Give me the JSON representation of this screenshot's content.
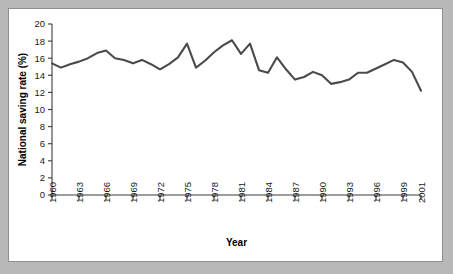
{
  "chart_data": {
    "type": "line",
    "title": "",
    "xlabel": "Year",
    "ylabel": "National saving rate (%)",
    "xlim": [
      1960,
      2001
    ],
    "ylim": [
      0,
      20
    ],
    "grid": false,
    "legend": null,
    "line_color": "#4a4a4a",
    "x_tick_labels": [
      "1960",
      "1963",
      "1966",
      "1969",
      "1972",
      "1975",
      "1978",
      "1981",
      "1984",
      "1987",
      "1990",
      "1993",
      "1996",
      "1999",
      "2001"
    ],
    "x_tick_values": [
      1960,
      1963,
      1966,
      1969,
      1972,
      1975,
      1978,
      1981,
      1984,
      1987,
      1990,
      1993,
      1996,
      1999,
      2001
    ],
    "y_tick_labels": [
      "0",
      "2",
      "4",
      "6",
      "8",
      "10",
      "12",
      "14",
      "16",
      "18",
      "20"
    ],
    "y_tick_values": [
      0,
      2,
      4,
      6,
      8,
      10,
      12,
      14,
      16,
      18,
      20
    ],
    "x": [
      1960,
      1961,
      1962,
      1963,
      1964,
      1965,
      1966,
      1967,
      1968,
      1969,
      1970,
      1971,
      1972,
      1973,
      1974,
      1975,
      1976,
      1977,
      1978,
      1979,
      1980,
      1981,
      1982,
      1983,
      1984,
      1985,
      1986,
      1987,
      1988,
      1989,
      1990,
      1991,
      1992,
      1993,
      1994,
      1995,
      1996,
      1997,
      1998,
      1999,
      2000,
      2001
    ],
    "values": [
      15.4,
      14.9,
      15.3,
      15.6,
      16.0,
      16.6,
      16.9,
      16.0,
      15.8,
      15.4,
      15.8,
      15.3,
      14.7,
      15.3,
      16.1,
      17.7,
      14.9,
      15.7,
      16.7,
      17.5,
      18.1,
      16.5,
      17.7,
      14.6,
      14.3,
      16.1,
      14.7,
      13.5,
      13.8,
      14.4,
      14.0,
      13.0,
      13.2,
      13.5,
      14.3,
      14.3,
      14.8,
      15.3,
      15.8,
      15.5,
      14.4,
      12.2
    ],
    "series": [
      {
        "name": "National saving rate",
        "values": [
          15.4,
          14.9,
          15.3,
          15.6,
          16.0,
          16.6,
          16.9,
          16.0,
          15.8,
          15.4,
          15.8,
          15.3,
          14.7,
          15.3,
          16.1,
          17.7,
          14.9,
          15.7,
          16.7,
          17.5,
          18.1,
          16.5,
          17.7,
          14.6,
          14.3,
          16.1,
          14.7,
          13.5,
          13.8,
          14.4,
          14.0,
          13.0,
          13.2,
          13.5,
          14.3,
          14.3,
          14.8,
          15.3,
          15.8,
          15.5,
          14.4,
          12.2
        ]
      }
    ]
  }
}
